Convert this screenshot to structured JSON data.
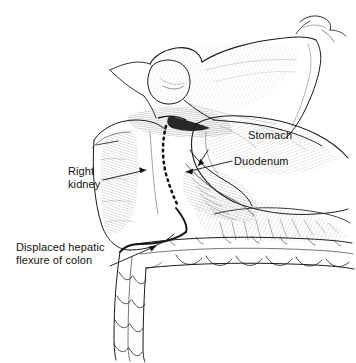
{
  "figure": {
    "kind": "anatomical-line-drawing",
    "title": "",
    "width": 356,
    "height": 363,
    "background_color": "#ffffff",
    "ink_color": "#1a1a1a",
    "shading_color": "#555555"
  },
  "labels": {
    "stomach": "Stomach",
    "duodenum": "Duodenum",
    "right_kidney_line1": "Right",
    "right_kidney_line2": "kidney",
    "colon_line1": "Displaced hepatic",
    "colon_line2": "flexure of colon"
  },
  "structures": [
    {
      "name": "liver",
      "label": ""
    },
    {
      "name": "gallbladder",
      "label": ""
    },
    {
      "name": "stomach",
      "label": "Stomach"
    },
    {
      "name": "duodenum",
      "label": "Duodenum"
    },
    {
      "name": "right-kidney",
      "label": "Right kidney"
    },
    {
      "name": "hepatic-flexure-of-colon",
      "label": "Displaced hepatic flexure of colon"
    },
    {
      "name": "dissection-dashed-line",
      "label": ""
    }
  ]
}
